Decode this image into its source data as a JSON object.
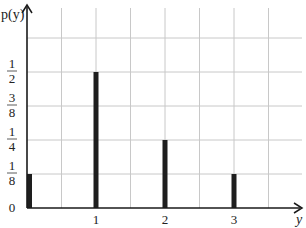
{
  "chart_data": {
    "type": "bar",
    "title": "",
    "xlabel": "y",
    "ylabel": "p(y)",
    "categories": [
      "0",
      "1",
      "2",
      "3"
    ],
    "x": [
      0,
      1,
      2,
      3
    ],
    "values": [
      0.125,
      0.5,
      0.25,
      0.125
    ],
    "value_labels": [
      "1/8",
      "1/2",
      "1/4",
      "1/8"
    ],
    "xlim": [
      0,
      4
    ],
    "ylim": [
      0,
      0.625
    ],
    "x_ticks": [
      {
        "value": 1,
        "label": "1"
      },
      {
        "value": 2,
        "label": "2"
      },
      {
        "value": 3,
        "label": "3"
      }
    ],
    "y_ticks": [
      {
        "value": 0,
        "num": "0",
        "den": ""
      },
      {
        "value": 0.125,
        "num": "1",
        "den": "8"
      },
      {
        "value": 0.25,
        "num": "1",
        "den": "4"
      },
      {
        "value": 0.375,
        "num": "3",
        "den": "8"
      },
      {
        "value": 0.5,
        "num": "1",
        "den": "2"
      }
    ],
    "grid": true,
    "grid_x_step": 0.5,
    "grid_y_step": 0.125,
    "legend": null,
    "bar_color": "#1e1e1e",
    "grid_color": "#c8c8c8",
    "axis_color": "#1a1a1a"
  }
}
